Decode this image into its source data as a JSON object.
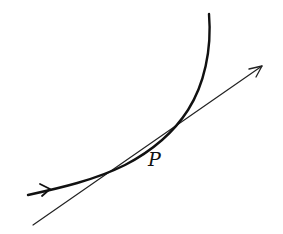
{
  "diagram": {
    "type": "curve-with-tangent",
    "point_label": "P",
    "colors": {
      "background": "#ffffff",
      "ink": "#111111"
    },
    "elements": [
      {
        "name": "curve",
        "description": "directed smooth curve bending upward, arrow indicating direction of travel"
      },
      {
        "name": "tangent-line",
        "description": "straight tangent line touching the curve at P, arrowhead at upper right"
      },
      {
        "name": "point-label",
        "text": "P"
      }
    ]
  }
}
